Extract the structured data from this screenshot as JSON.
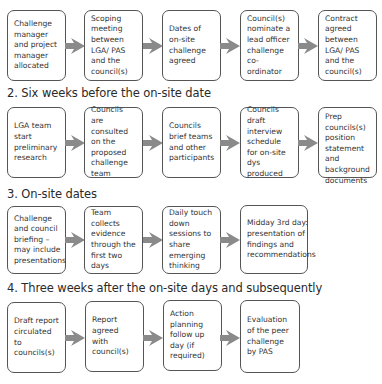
{
  "title_partial": "1. ...",
  "sections": [
    {
      "heading": "",
      "steps": [
        "Challenge manager and project manager allocated",
        "Scoping meeting between LGA/ PAS and the council(s)",
        "Dates of on-site challenge agreed",
        "Council(s) nominate a lead officer challenge co-ordinator",
        "Contract agreed between LGA/ PAS and the council(s)"
      ]
    },
    {
      "heading": "2. Six weeks before the on-site date",
      "steps": [
        "LGA team start preliminary research",
        "Councils are consulted on the proposed challenge team",
        "Councils brief teams and other participants",
        "Councils draft interview schedule for on-site dys produced",
        "Prep councils(s) position statement and background documents"
      ]
    },
    {
      "heading": "3. On-site dates",
      "steps": [
        "Challenge and council briefing – may include presentations",
        "Team collects evidence through the first two days",
        "Daily touch down sessions to share emerging thinking",
        "Midday 3rd day: presentation of findings and recommendations"
      ]
    },
    {
      "heading": "4. Three weeks after the on-site days and subsequently",
      "steps": [
        "Draft report circulated to councils(s)",
        "Report agreed with council(s)",
        "Action planning follow up day (if required)",
        "Evaluation of the peer challenge by PAS"
      ]
    }
  ],
  "colors": {
    "box_border": "#555555",
    "arrow": "#8a8a8a",
    "text": "#333333"
  }
}
